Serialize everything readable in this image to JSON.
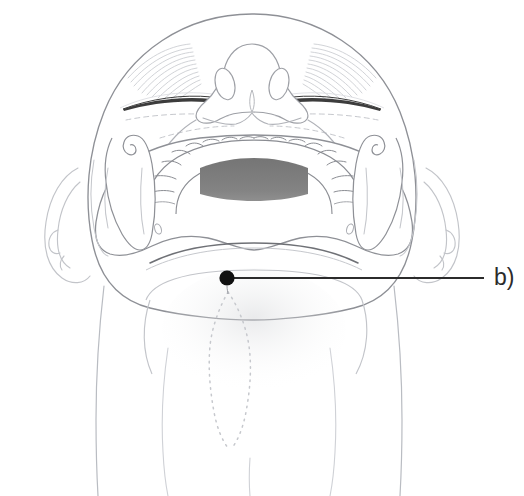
{
  "figure": {
    "view": "inferior-submental-view",
    "background_color": "#ffffff"
  },
  "annotations": [
    {
      "id": "b",
      "label": "b)",
      "marker": "filled-dot",
      "marker_color": "#111111",
      "marker_x": 227,
      "marker_y": 278,
      "marker_radius": 7.5,
      "leader_line_color": "#2b2b2b",
      "leader_line_from_x": 227,
      "leader_line_from_y": 278,
      "leader_line_to_x": 484,
      "leader_line_to_y": 278,
      "label_x": 494,
      "label_y": 266,
      "target_region": "submental-point"
    }
  ],
  "anatomy": {
    "head_outline_color": "#8e9096",
    "soft_line_color": "#b9bcc2",
    "faint_line_color": "#d7d9dd",
    "eyelid_color": "#3c3c3c",
    "teeth_fill": "#ffffff",
    "teeth_outline_color": "#8b8d93",
    "anterior_teeth_shade": "#7c7c7c",
    "oral_shadow_color": "#8a8a8a",
    "dashed_line_color": "#c6c8cd",
    "parts": [
      {
        "name": "cranium-outline",
        "label": "Cranium / scalp outline"
      },
      {
        "name": "left-eyebrow",
        "label": "Left eyebrow"
      },
      {
        "name": "right-eyebrow",
        "label": "Right eyebrow"
      },
      {
        "name": "left-eyelid",
        "label": "Left closed eyelid"
      },
      {
        "name": "right-eyelid",
        "label": "Right closed eyelid"
      },
      {
        "name": "nose-dorsum",
        "label": "Nose"
      },
      {
        "name": "left-nostril",
        "label": "Left nostril"
      },
      {
        "name": "right-nostril",
        "label": "Right nostril"
      },
      {
        "name": "upper-lip",
        "label": "Upper lip"
      },
      {
        "name": "mandibular-dental-arch",
        "label": "Mandibular dental arch"
      },
      {
        "name": "anterior-teeth-shading",
        "label": "Anterior teeth lingual shading"
      },
      {
        "name": "oral-cavity-shadow",
        "label": "Floor of mouth shadow"
      },
      {
        "name": "left-mandibular-ramus",
        "label": "Left mandibular ramus"
      },
      {
        "name": "right-mandibular-ramus",
        "label": "Right mandibular ramus"
      },
      {
        "name": "left-coronoid-condyle",
        "label": "Left coronoid process and condyle"
      },
      {
        "name": "right-coronoid-condyle",
        "label": "Right coronoid process and condyle"
      },
      {
        "name": "left-mental-foramen",
        "label": "Left mental foramen"
      },
      {
        "name": "right-mental-foramen",
        "label": "Right mental foramen"
      },
      {
        "name": "mandibular-symphysis",
        "label": "Mandibular symphysis / chin border"
      },
      {
        "name": "left-ear",
        "label": "Left ear"
      },
      {
        "name": "right-ear",
        "label": "Right ear"
      },
      {
        "name": "submental-triangle",
        "label": "Submental triangle (dotted outline)"
      },
      {
        "name": "neck-outline",
        "label": "Neck outline"
      },
      {
        "name": "sternocleidomastoid-left",
        "label": "Left sternocleidomastoid contour"
      },
      {
        "name": "sternocleidomastoid-right",
        "label": "Right sternocleidomastoid contour"
      }
    ]
  },
  "teeth": {
    "total_visible": 16,
    "shaded_count": 6,
    "shaded_positions": [
      "central-incisor-left",
      "central-incisor-right",
      "lateral-incisor-left",
      "lateral-incisor-right",
      "canine-left",
      "canine-right"
    ]
  }
}
